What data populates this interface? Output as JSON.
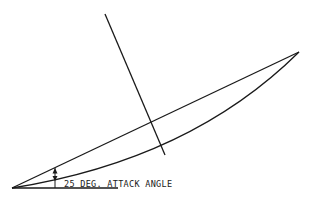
{
  "diagram": {
    "type": "airfoil-attack-angle",
    "annotation": "25 DEG. ATTACK ANGLE",
    "colors": {
      "background": "#ffffff",
      "line": "#1a1a1a"
    },
    "geometry": {
      "origin": [
        12,
        188
      ],
      "tip": [
        299,
        52
      ],
      "baseline_end": [
        118,
        188
      ],
      "normal_line_start": [
        105,
        14
      ],
      "normal_line_end": [
        165,
        155
      ],
      "angle_arc_x": 55
    }
  }
}
